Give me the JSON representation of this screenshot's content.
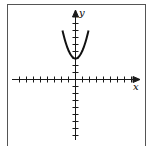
{
  "figure": {
    "x_label": "x",
    "y_label": "y",
    "curve": "parabola opening upward, vertex on positive y-axis",
    "colors": {
      "ink": "#1a1a1a",
      "frame": "#555555",
      "background": "#ffffff"
    }
  },
  "chart_data": {
    "type": "line",
    "title": "",
    "xlabel": "x",
    "ylabel": "y",
    "x_ticks_each_side": 8,
    "y_ticks_up": 8,
    "y_ticks_down": 8,
    "xlim": [
      -8,
      8
    ],
    "ylim": [
      -8,
      9
    ],
    "series": [
      {
        "name": "y = x^2 + 3",
        "x": [
          -2,
          -1.5,
          -1,
          -0.5,
          0,
          0.5,
          1,
          1.5,
          2
        ],
        "y": [
          9,
          5.25,
          4,
          3.25,
          3,
          3.25,
          4,
          5.25,
          9
        ]
      }
    ],
    "grid": false
  }
}
